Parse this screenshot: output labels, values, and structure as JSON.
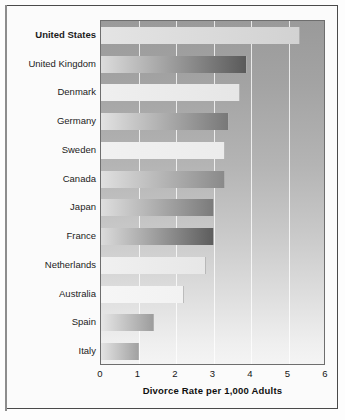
{
  "chart_data": {
    "type": "bar",
    "orientation": "horizontal",
    "title": "",
    "xlabel": "Divorce Rate per 1,000 Adults",
    "ylabel": "",
    "xlim": [
      0,
      6
    ],
    "xticks": [
      "0",
      "1",
      "2",
      "3",
      "4",
      "5",
      "6"
    ],
    "grid": true,
    "legend": false,
    "highlight_category": "United States",
    "categories": [
      "United States",
      "United Kingdom",
      "Denmark",
      "Germany",
      "Sweden",
      "Canada",
      "Japan",
      "France",
      "Netherlands",
      "Australia",
      "Spain",
      "Italy"
    ],
    "values": [
      5.3,
      3.9,
      3.7,
      3.4,
      3.3,
      3.3,
      3.0,
      3.0,
      2.8,
      2.2,
      1.4,
      1.0
    ],
    "bars": [
      {
        "label": "United States",
        "value": 5.3,
        "start_color": "#e4e4e4",
        "end_color": "#d2d2d2"
      },
      {
        "label": "United Kingdom",
        "value": 3.9,
        "start_color": "#dcdcdc",
        "end_color": "#5a5a5a"
      },
      {
        "label": "Denmark",
        "value": 3.7,
        "start_color": "#efefef",
        "end_color": "#e6e6e6"
      },
      {
        "label": "Germany",
        "value": 3.4,
        "start_color": "#e2e2e2",
        "end_color": "#787878"
      },
      {
        "label": "Sweden",
        "value": 3.3,
        "start_color": "#f1f1f1",
        "end_color": "#ececec"
      },
      {
        "label": "Canada",
        "value": 3.3,
        "start_color": "#e0e0e0",
        "end_color": "#8a8a8a"
      },
      {
        "label": "Japan",
        "value": 3.0,
        "start_color": "#dedede",
        "end_color": "#7b7b7b"
      },
      {
        "label": "France",
        "value": 3.0,
        "start_color": "#dbdbdb",
        "end_color": "#5d5d5d"
      },
      {
        "label": "Netherlands",
        "value": 2.8,
        "start_color": "#f0f0f0",
        "end_color": "#e7e7e7"
      },
      {
        "label": "Australia",
        "value": 2.2,
        "start_color": "#f6f6f6",
        "end_color": "#f2f2f2"
      },
      {
        "label": "Spain",
        "value": 1.4,
        "start_color": "#e6e6e6",
        "end_color": "#9d9d9d"
      },
      {
        "label": "Italy",
        "value": 1.0,
        "start_color": "#e3e3e3",
        "end_color": "#a2a2a2"
      }
    ]
  }
}
